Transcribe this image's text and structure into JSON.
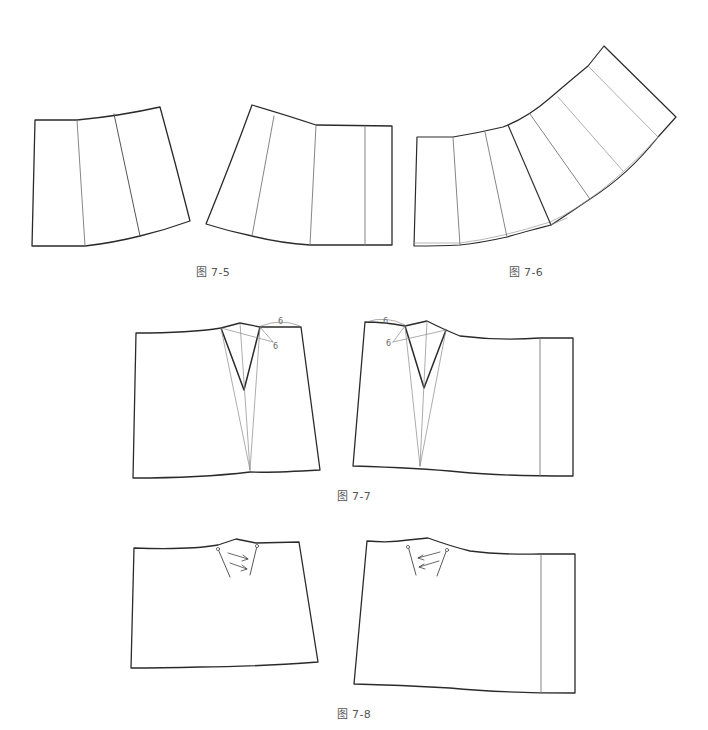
{
  "colors": {
    "outline": "#2a2a2a",
    "seam": "#777777",
    "thin": "#999999",
    "label": "#555555"
  },
  "figures": [
    {
      "id": "fig-7-5",
      "caption": "图 7-5",
      "description": "Two skirt pattern pieces split into panels, slashed and spread (flare)"
    },
    {
      "id": "fig-7-6",
      "caption": "图 7-6",
      "description": "Pattern piece spread into curved fan of panels"
    },
    {
      "id": "fig-7-7",
      "caption": "图 7-7",
      "description": "Front and back skirt blocks with dart manipulation lines",
      "dimension_labels": [
        "6",
        "6",
        "6",
        "6"
      ]
    },
    {
      "id": "fig-7-8",
      "caption": "图 7-8",
      "description": "Front and back skirt blocks with pleat direction arrows"
    }
  ]
}
